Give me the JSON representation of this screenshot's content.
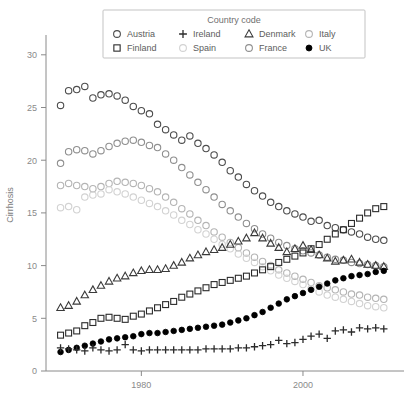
{
  "chart": {
    "ylabel": "Cirrhosis",
    "xlabel": "",
    "title": ""
  },
  "legend": {
    "title": "Country code",
    "entries": [
      {
        "label": "Austria",
        "marker": "circle-open",
        "color": "#4d4d4d"
      },
      {
        "label": "Finland",
        "marker": "square-open",
        "color": "#2b2b2b"
      },
      {
        "label": "Ireland",
        "marker": "plus",
        "color": "#2b2b2b"
      },
      {
        "label": "Spain",
        "marker": "circle-open",
        "color": "#d2d2d2"
      },
      {
        "label": "Denmark",
        "marker": "triangle-open",
        "color": "#3a3a3a"
      },
      {
        "label": "France",
        "marker": "circle-open",
        "color": "#8f8f8f"
      },
      {
        "label": "Italy",
        "marker": "circle-open",
        "color": "#b4b4b4"
      },
      {
        "label": "UK",
        "marker": "circle-filled",
        "color": "#000000"
      }
    ]
  },
  "axes": {
    "y_ticks": [
      0,
      5,
      10,
      15,
      20,
      25,
      30
    ],
    "x_ticks": [
      1980,
      2000
    ],
    "ylim": [
      0,
      31.5
    ],
    "xlim": [
      1968.2,
      2012.5
    ]
  },
  "chart_data": {
    "type": "scatter",
    "title": "",
    "xlabel": "",
    "ylabel": "Cirrhosis",
    "xlim": [
      1968.2,
      2012.5
    ],
    "ylim": [
      0,
      31.5
    ],
    "grid": false,
    "legend_position": "top-center",
    "legend_title": "Country code",
    "x": [
      1970,
      1971,
      1972,
      1973,
      1974,
      1975,
      1976,
      1977,
      1978,
      1979,
      1980,
      1981,
      1982,
      1983,
      1984,
      1985,
      1986,
      1987,
      1988,
      1989,
      1990,
      1991,
      1992,
      1993,
      1994,
      1995,
      1996,
      1997,
      1998,
      1999,
      2000,
      2001,
      2002,
      2003,
      2004,
      2005,
      2006,
      2007,
      2008,
      2009,
      2010
    ],
    "series": [
      {
        "name": "Austria",
        "marker": "circle-open",
        "color": "#4d4d4d",
        "values": [
          25.2,
          26.6,
          26.7,
          27.0,
          25.9,
          26.2,
          26.3,
          26.1,
          25.7,
          25.1,
          24.7,
          24.4,
          23.4,
          22.9,
          22.4,
          21.9,
          22.3,
          21.6,
          21.1,
          20.5,
          19.8,
          19.0,
          18.4,
          17.7,
          17.1,
          16.6,
          16.0,
          15.6,
          15.2,
          14.9,
          14.6,
          14.2,
          14.3,
          13.8,
          13.6,
          13.4,
          13.2,
          13.0,
          12.7,
          12.5,
          12.4
        ]
      },
      {
        "name": "France",
        "marker": "circle-open",
        "color": "#8f8f8f",
        "values": [
          19.7,
          20.8,
          21.0,
          20.9,
          20.6,
          20.9,
          21.3,
          21.6,
          21.8,
          21.9,
          21.7,
          21.4,
          21.2,
          20.6,
          20.0,
          19.3,
          18.6,
          17.9,
          17.2,
          16.5,
          15.8,
          15.2,
          14.6,
          14.0,
          13.5,
          13.0,
          12.6,
          12.2,
          11.9,
          11.6,
          11.4,
          11.2,
          11.0,
          10.8,
          10.6,
          10.5,
          10.3,
          10.2,
          10.1,
          10.0,
          9.9
        ]
      },
      {
        "name": "Italy",
        "marker": "circle-open",
        "color": "#b4b4b4",
        "values": [
          17.6,
          17.8,
          17.6,
          17.5,
          17.3,
          17.5,
          17.8,
          18.0,
          17.9,
          17.8,
          17.6,
          17.3,
          17.0,
          16.5,
          16.0,
          15.4,
          14.9,
          14.3,
          13.8,
          13.2,
          12.7,
          12.2,
          11.7,
          11.2,
          10.8,
          10.4,
          10.0,
          9.6,
          9.3,
          9.0,
          8.7,
          8.4,
          8.1,
          7.9,
          7.7,
          7.5,
          7.3,
          7.2,
          7.0,
          6.9,
          6.8
        ]
      },
      {
        "name": "Spain",
        "marker": "circle-open",
        "color": "#d2d2d2",
        "values": [
          15.5,
          15.6,
          15.3,
          16.5,
          16.7,
          16.8,
          17.2,
          17.0,
          16.8,
          16.5,
          16.2,
          15.9,
          15.6,
          15.2,
          14.8,
          14.3,
          13.9,
          13.4,
          13.0,
          12.5,
          12.0,
          11.6,
          11.1,
          10.7,
          10.3,
          9.9,
          9.5,
          9.1,
          8.8,
          8.5,
          8.2,
          7.8,
          7.5,
          7.2,
          7.0,
          6.8,
          6.6,
          6.4,
          6.2,
          6.1,
          6.0
        ]
      },
      {
        "name": "Denmark",
        "marker": "triangle-open",
        "color": "#3a3a3a",
        "values": [
          6.0,
          6.2,
          6.6,
          7.2,
          7.7,
          8.1,
          8.5,
          8.8,
          9.0,
          9.3,
          9.5,
          9.6,
          9.6,
          9.7,
          10.0,
          10.3,
          10.7,
          11.0,
          11.3,
          11.5,
          11.7,
          12.0,
          12.3,
          12.6,
          13.1,
          12.6,
          12.1,
          11.7,
          11.3,
          11.6,
          11.9,
          11.5,
          11.0,
          10.7,
          10.4,
          10.5,
          10.6,
          10.3,
          10.1,
          10.0,
          9.9
        ]
      },
      {
        "name": "Finland",
        "marker": "square-open",
        "color": "#2b2b2b",
        "values": [
          3.4,
          3.6,
          3.8,
          4.3,
          4.6,
          5.0,
          5.1,
          5.0,
          4.9,
          5.2,
          5.4,
          5.7,
          6.0,
          6.3,
          6.6,
          7.0,
          7.3,
          7.6,
          7.9,
          8.2,
          8.4,
          8.6,
          8.8,
          9.0,
          9.3,
          9.6,
          9.9,
          10.3,
          10.6,
          10.9,
          11.2,
          11.6,
          12.0,
          12.5,
          13.0,
          13.4,
          14.0,
          14.5,
          15.0,
          15.4,
          15.6
        ]
      },
      {
        "name": "UK",
        "marker": "circle-filled",
        "color": "#000000",
        "values": [
          1.8,
          2.0,
          2.2,
          2.4,
          2.6,
          2.8,
          3.0,
          3.1,
          3.2,
          3.3,
          3.5,
          3.6,
          3.6,
          3.7,
          3.8,
          3.9,
          4.0,
          4.1,
          4.2,
          4.3,
          4.4,
          4.6,
          4.8,
          5.0,
          5.3,
          5.6,
          6.0,
          6.4,
          6.8,
          7.1,
          7.4,
          7.7,
          8.0,
          8.3,
          8.6,
          8.8,
          9.0,
          9.1,
          9.2,
          9.4,
          9.5
        ]
      },
      {
        "name": "Ireland",
        "marker": "plus",
        "color": "#2b2b2b",
        "values": [
          2.2,
          2.1,
          2.0,
          1.9,
          2.2,
          2.0,
          1.9,
          2.0,
          2.5,
          2.0,
          1.9,
          2.0,
          2.0,
          2.0,
          2.0,
          2.0,
          2.0,
          2.0,
          2.1,
          2.1,
          2.1,
          2.1,
          2.2,
          2.2,
          2.3,
          2.4,
          2.5,
          2.9,
          2.6,
          2.7,
          3.0,
          3.3,
          3.5,
          3.1,
          3.8,
          3.9,
          3.7,
          4.1,
          4.0,
          4.1,
          4.0
        ]
      }
    ]
  }
}
